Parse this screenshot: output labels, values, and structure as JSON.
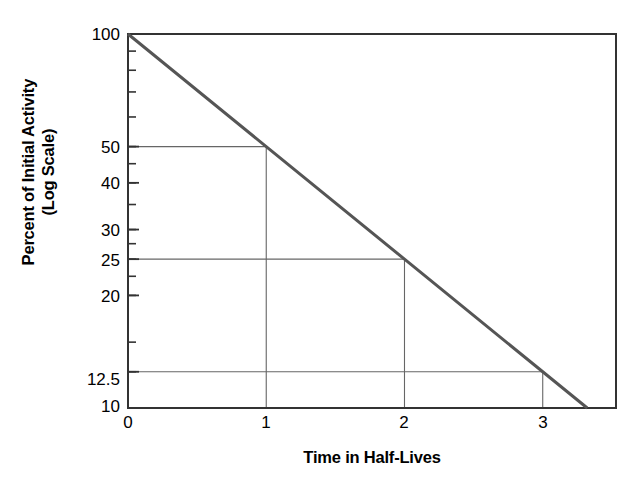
{
  "chart_data": {
    "type": "line",
    "title": "",
    "xlabel": "Time in Half-Lives",
    "ylabel": "Percent of Initial Activity (Log Scale)",
    "ylabel_lines": [
      "Percent of Initial Activity",
      "(Log Scale)"
    ],
    "yscale": "log",
    "ylim": [
      10,
      100
    ],
    "xlim": [
      0,
      3.53
    ],
    "grid": false,
    "legend": null,
    "x_tick_labels": [
      "0",
      "1",
      "2",
      "3"
    ],
    "x_ticks": [
      0,
      1,
      2,
      3
    ],
    "y_tick_labels": [
      "100",
      "50",
      "40",
      "30",
      "25",
      "20",
      "12.5",
      "10"
    ],
    "y_ticks": [
      100,
      50,
      40,
      30,
      25,
      20,
      12.5,
      10
    ],
    "y_minor_ticks": [
      90,
      80,
      70,
      60,
      50,
      45,
      40,
      35,
      30,
      27.5,
      25,
      22.5,
      20,
      15,
      12.5
    ],
    "series": [
      {
        "name": "Radioactive decay",
        "x": [
          0,
          1,
          2,
          3,
          3.3219
        ],
        "values": [
          100,
          50,
          25,
          12.5,
          10
        ],
        "color": "#555555",
        "width": 3
      }
    ],
    "annotations": [
      {
        "type": "guide",
        "label": "half-life 1",
        "x": 1,
        "y": 50
      },
      {
        "type": "guide",
        "label": "half-life 2",
        "x": 2,
        "y": 25
      },
      {
        "type": "guide",
        "label": "half-life 3",
        "x": 3,
        "y": 12.5
      }
    ],
    "axis_color": "#333333",
    "guide_color": "#666666",
    "background": "#ffffff"
  }
}
